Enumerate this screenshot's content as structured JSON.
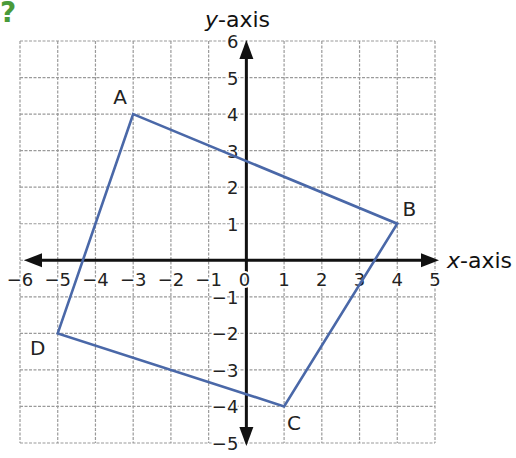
{
  "question_mark": "?",
  "axes": {
    "x_label": "x",
    "x_suffix": "-axis",
    "y_label": "y",
    "y_suffix": "-axis",
    "x_min": -6,
    "x_max": 5,
    "y_min": -5,
    "y_max": 6,
    "x_ticks": [
      "-6",
      "-5",
      "-4",
      "-3",
      "-2",
      "-1",
      "0",
      "1",
      "2",
      "3",
      "4",
      "5"
    ],
    "y_ticks": [
      "6",
      "5",
      "4",
      "3",
      "2",
      "1",
      "-1",
      "-2",
      "-3",
      "-4",
      "-5"
    ]
  },
  "colors": {
    "grid": "#9a9a9a",
    "axis": "#111111",
    "shape": "#4a68a8",
    "accent": "#4a9a3a"
  },
  "points": [
    {
      "label": "A",
      "x": -3,
      "y": 4
    },
    {
      "label": "B",
      "x": 4,
      "y": 1
    },
    {
      "label": "C",
      "x": 1,
      "y": -4
    },
    {
      "label": "D",
      "x": -5,
      "y": -2
    }
  ]
}
